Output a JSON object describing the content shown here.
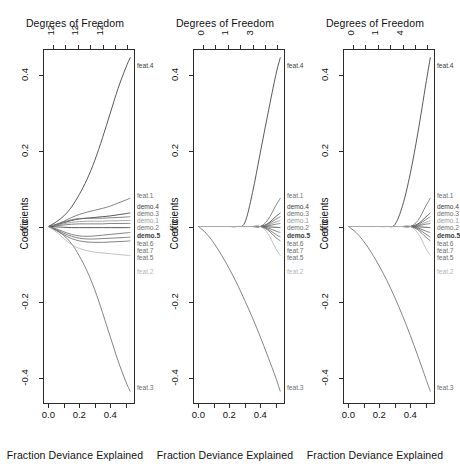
{
  "figure": {
    "panel_count": 3,
    "x_axis_title": "Fraction Deviance Explained",
    "top_axis_title": "Degrees of Freedom",
    "y_axis_title": "Coefficients",
    "x_ticks": [
      "0.0",
      "0.2",
      "0.4"
    ],
    "x_tick_values": [
      0.0,
      0.2,
      0.4
    ],
    "y_ticks": [
      "0.4",
      "0.2",
      "0.0",
      "-0.2",
      "-0.4"
    ],
    "y_tick_values": [
      0.4,
      0.2,
      0.0,
      -0.2,
      -0.4
    ],
    "xlim": [
      -0.035,
      0.56
    ],
    "ylim": [
      -0.47,
      0.47
    ],
    "curve_colors": {
      "dark": "#3b3b3b",
      "mid": "#6e6e6e",
      "light": "#9a9a9a",
      "faint": "#b6b6b6",
      "axis": "#2b2b2b"
    }
  },
  "chart_data": [
    {
      "type": "line",
      "title": "Degrees of Freedom",
      "xlabel": "Fraction Deviance Explained",
      "ylabel": "Coefficients",
      "xlim": [
        -0.035,
        0.56
      ],
      "ylim": [
        -0.47,
        0.47
      ],
      "grid": false,
      "legend": "endpoint-labels-right",
      "top_axis": {
        "label": "Degrees of Freedom",
        "tick_labels": [
          "12",
          "12",
          "12"
        ],
        "tick_positions": [
          0.03,
          0.19,
          0.35
        ],
        "minor_tick_positions": [
          0.11,
          0.27,
          0.43,
          0.51
        ]
      },
      "x": [
        0.0,
        0.05,
        0.1,
        0.15,
        0.2,
        0.25,
        0.3,
        0.35,
        0.4,
        0.45,
        0.5,
        0.53
      ],
      "series": [
        {
          "name": "feat.4",
          "color": "dark",
          "bold": false,
          "values": [
            0.0,
            0.012,
            0.028,
            0.052,
            0.085,
            0.125,
            0.175,
            0.235,
            0.3,
            0.365,
            0.42,
            0.448
          ]
        },
        {
          "name": "feat.3",
          "color": "mid",
          "bold": false,
          "values": [
            0.0,
            -0.01,
            -0.024,
            -0.046,
            -0.078,
            -0.118,
            -0.168,
            -0.228,
            -0.292,
            -0.355,
            -0.41,
            -0.437
          ]
        },
        {
          "name": "feat.1",
          "color": "mid",
          "bold": false,
          "values": [
            0.0,
            0.006,
            0.014,
            0.024,
            0.032,
            0.038,
            0.043,
            0.048,
            0.054,
            0.062,
            0.07,
            0.075
          ]
        },
        {
          "name": "demo.4",
          "color": "dark",
          "bold": false,
          "values": [
            0.0,
            0.004,
            0.01,
            0.016,
            0.02,
            0.022,
            0.024,
            0.026,
            0.028,
            0.031,
            0.034,
            0.036
          ]
        },
        {
          "name": "demo.3",
          "color": "mid",
          "bold": false,
          "values": [
            0.0,
            0.005,
            0.012,
            0.018,
            0.021,
            0.022,
            0.022,
            0.022,
            0.023,
            0.024,
            0.025,
            0.026
          ]
        },
        {
          "name": "demo.1",
          "color": "light",
          "bold": false,
          "values": [
            0.0,
            0.003,
            0.007,
            0.011,
            0.013,
            0.014,
            0.014,
            0.014,
            0.015,
            0.015,
            0.016,
            0.016
          ]
        },
        {
          "name": "demo.2",
          "color": "mid",
          "bold": false,
          "values": [
            0.0,
            0.002,
            0.004,
            0.006,
            0.007,
            0.007,
            0.007,
            0.007,
            0.008,
            0.008,
            0.008,
            0.008
          ]
        },
        {
          "name": "demo.5",
          "color": "dark",
          "bold": true,
          "values": [
            0.0,
            -0.001,
            -0.002,
            -0.003,
            -0.003,
            -0.003,
            -0.003,
            -0.003,
            -0.003,
            -0.003,
            -0.003,
            -0.003
          ]
        },
        {
          "name": "feat.6",
          "color": "mid",
          "bold": false,
          "values": [
            0.0,
            -0.006,
            -0.014,
            -0.021,
            -0.025,
            -0.026,
            -0.025,
            -0.023,
            -0.021,
            -0.019,
            -0.017,
            -0.016
          ]
        },
        {
          "name": "feat.7",
          "color": "mid",
          "bold": false,
          "values": [
            0.0,
            -0.008,
            -0.018,
            -0.026,
            -0.031,
            -0.033,
            -0.033,
            -0.032,
            -0.031,
            -0.03,
            -0.029,
            -0.028
          ]
        },
        {
          "name": "feat.5",
          "color": "mid",
          "bold": false,
          "values": [
            0.0,
            -0.01,
            -0.022,
            -0.032,
            -0.038,
            -0.041,
            -0.042,
            -0.042,
            -0.041,
            -0.04,
            -0.039,
            -0.038
          ]
        },
        {
          "name": "feat.2",
          "color": "faint",
          "bold": false,
          "values": [
            0.0,
            -0.014,
            -0.032,
            -0.048,
            -0.058,
            -0.064,
            -0.068,
            -0.07,
            -0.072,
            -0.074,
            -0.076,
            -0.077
          ]
        }
      ]
    },
    {
      "type": "line",
      "title": "Degrees of Freedom",
      "xlabel": "Fraction Deviance Explained",
      "ylabel": "Coefficients",
      "xlim": [
        -0.035,
        0.56
      ],
      "ylim": [
        -0.47,
        0.47
      ],
      "grid": false,
      "legend": "endpoint-labels-right",
      "top_axis": {
        "label": "Degrees of Freedom",
        "tick_labels": [
          "0",
          "1",
          "3"
        ],
        "tick_positions": [
          0.03,
          0.19,
          0.35
        ],
        "minor_tick_positions": [
          0.11,
          0.27,
          0.43,
          0.51
        ]
      },
      "x": [
        0.0,
        0.05,
        0.1,
        0.15,
        0.2,
        0.25,
        0.3,
        0.35,
        0.4,
        0.45,
        0.5,
        0.53
      ],
      "series": [
        {
          "name": "feat.4",
          "color": "dark",
          "bold": false,
          "values": [
            0.0,
            0.0,
            0.0,
            0.0,
            0.0,
            0.0,
            0.01,
            0.09,
            0.195,
            0.3,
            0.4,
            0.448
          ]
        },
        {
          "name": "feat.3",
          "color": "mid",
          "bold": false,
          "values": [
            0.0,
            -0.018,
            -0.044,
            -0.076,
            -0.112,
            -0.152,
            -0.196,
            -0.242,
            -0.292,
            -0.345,
            -0.4,
            -0.437
          ]
        },
        {
          "name": "feat.1",
          "color": "mid",
          "bold": false,
          "values": [
            0.0,
            0.0,
            0.0,
            0.0,
            0.0,
            0.0,
            0.0,
            0.0,
            0.0,
            0.018,
            0.055,
            0.075
          ]
        },
        {
          "name": "demo.4",
          "color": "dark",
          "bold": false,
          "values": [
            0.0,
            0.0,
            0.0,
            0.0,
            0.0,
            0.0,
            0.0,
            0.0,
            0.0,
            0.008,
            0.026,
            0.036
          ]
        },
        {
          "name": "demo.3",
          "color": "mid",
          "bold": false,
          "values": [
            0.0,
            0.0,
            0.0,
            0.0,
            0.0,
            0.0,
            0.0,
            0.0,
            0.0,
            0.006,
            0.019,
            0.026
          ]
        },
        {
          "name": "demo.1",
          "color": "light",
          "bold": false,
          "values": [
            0.0,
            0.0,
            0.0,
            0.0,
            0.0,
            0.0,
            0.0,
            0.0,
            0.0,
            0.004,
            0.012,
            0.016
          ]
        },
        {
          "name": "demo.2",
          "color": "mid",
          "bold": false,
          "values": [
            0.0,
            0.0,
            0.0,
            0.0,
            0.0,
            0.0,
            0.0,
            0.0,
            0.0,
            0.002,
            0.006,
            0.008
          ]
        },
        {
          "name": "demo.5",
          "color": "dark",
          "bold": true,
          "values": [
            0.0,
            0.0,
            0.0,
            0.0,
            0.0,
            0.0,
            0.0,
            0.0,
            0.0,
            -0.001,
            -0.002,
            -0.003
          ]
        },
        {
          "name": "feat.6",
          "color": "mid",
          "bold": false,
          "values": [
            0.0,
            0.0,
            0.0,
            0.0,
            0.0,
            0.0,
            0.0,
            0.0,
            0.0,
            -0.004,
            -0.012,
            -0.016
          ]
        },
        {
          "name": "feat.7",
          "color": "mid",
          "bold": false,
          "values": [
            0.0,
            0.0,
            0.0,
            0.0,
            0.0,
            0.0,
            0.0,
            0.0,
            0.0,
            -0.007,
            -0.021,
            -0.028
          ]
        },
        {
          "name": "feat.5",
          "color": "mid",
          "bold": false,
          "values": [
            0.0,
            0.0,
            0.0,
            0.0,
            0.0,
            0.0,
            0.0,
            0.0,
            0.0,
            -0.01,
            -0.029,
            -0.038
          ]
        },
        {
          "name": "feat.2",
          "color": "faint",
          "bold": false,
          "values": [
            0.0,
            0.0,
            0.0,
            0.0,
            0.0,
            0.0,
            0.0,
            0.0,
            0.0,
            -0.019,
            -0.058,
            -0.077
          ]
        }
      ]
    },
    {
      "type": "line",
      "title": "Degrees of Freedom",
      "xlabel": "Fraction Deviance Explained",
      "ylabel": "Coefficients",
      "xlim": [
        -0.035,
        0.56
      ],
      "ylim": [
        -0.47,
        0.47
      ],
      "grid": false,
      "legend": "endpoint-labels-right",
      "top_axis": {
        "label": "Degrees of Freedom",
        "tick_labels": [
          "0",
          "1",
          "4"
        ],
        "tick_positions": [
          0.03,
          0.19,
          0.35
        ],
        "minor_tick_positions": [
          0.11,
          0.27,
          0.43,
          0.51
        ]
      },
      "x": [
        0.0,
        0.05,
        0.1,
        0.15,
        0.2,
        0.25,
        0.3,
        0.35,
        0.4,
        0.45,
        0.5,
        0.53
      ],
      "series": [
        {
          "name": "feat.4",
          "color": "dark",
          "bold": false,
          "values": [
            0.0,
            0.0,
            0.0,
            0.0,
            0.0,
            0.0,
            0.005,
            0.055,
            0.14,
            0.25,
            0.375,
            0.448
          ]
        },
        {
          "name": "feat.3",
          "color": "mid",
          "bold": false,
          "values": [
            0.0,
            -0.016,
            -0.04,
            -0.07,
            -0.105,
            -0.144,
            -0.188,
            -0.236,
            -0.288,
            -0.344,
            -0.402,
            -0.437
          ]
        },
        {
          "name": "feat.1",
          "color": "mid",
          "bold": false,
          "values": [
            0.0,
            0.0,
            0.0,
            0.0,
            0.0,
            0.0,
            0.0,
            0.0,
            0.0,
            0.016,
            0.054,
            0.075
          ]
        },
        {
          "name": "demo.4",
          "color": "dark",
          "bold": false,
          "values": [
            0.0,
            0.0,
            0.0,
            0.0,
            0.0,
            0.0,
            0.0,
            0.0,
            0.0,
            0.007,
            0.025,
            0.036
          ]
        },
        {
          "name": "demo.3",
          "color": "mid",
          "bold": false,
          "values": [
            0.0,
            0.0,
            0.0,
            0.0,
            0.0,
            0.0,
            0.0,
            0.0,
            0.0,
            0.005,
            0.018,
            0.026
          ]
        },
        {
          "name": "demo.1",
          "color": "light",
          "bold": false,
          "values": [
            0.0,
            0.0,
            0.0,
            0.0,
            0.0,
            0.0,
            0.0,
            0.0,
            0.0,
            0.003,
            0.011,
            0.016
          ]
        },
        {
          "name": "demo.2",
          "color": "mid",
          "bold": false,
          "values": [
            0.0,
            0.0,
            0.0,
            0.0,
            0.0,
            0.0,
            0.0,
            0.0,
            0.0,
            0.002,
            0.006,
            0.008
          ]
        },
        {
          "name": "demo.5",
          "color": "dark",
          "bold": true,
          "values": [
            0.0,
            0.0,
            0.0,
            0.0,
            0.0,
            0.0,
            0.0,
            0.0,
            0.0,
            -0.001,
            -0.002,
            -0.003
          ]
        },
        {
          "name": "feat.6",
          "color": "mid",
          "bold": false,
          "values": [
            0.0,
            0.0,
            0.0,
            0.0,
            0.0,
            0.0,
            0.0,
            0.0,
            0.0,
            -0.004,
            -0.012,
            -0.016
          ]
        },
        {
          "name": "feat.7",
          "color": "mid",
          "bold": false,
          "values": [
            0.0,
            0.0,
            0.0,
            0.0,
            0.0,
            0.0,
            0.0,
            0.0,
            0.0,
            -0.006,
            -0.02,
            -0.028
          ]
        },
        {
          "name": "feat.5",
          "color": "mid",
          "bold": false,
          "values": [
            0.0,
            0.0,
            0.0,
            0.0,
            0.0,
            0.0,
            0.0,
            0.0,
            0.0,
            -0.009,
            -0.028,
            -0.038
          ]
        },
        {
          "name": "feat.2",
          "color": "faint",
          "bold": false,
          "values": [
            0.0,
            0.0,
            0.0,
            0.0,
            0.0,
            0.0,
            0.0,
            0.0,
            0.0,
            -0.018,
            -0.057,
            -0.077
          ]
        }
      ]
    }
  ]
}
